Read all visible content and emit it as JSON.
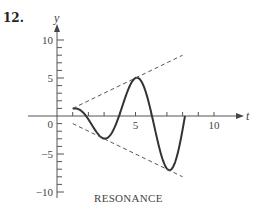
{
  "problem": {
    "number": "12."
  },
  "chart_data": {
    "type": "line",
    "title": "",
    "caption": "RESONANCE",
    "xlabel": "t",
    "ylabel": "y",
    "xlim": [
      0,
      11
    ],
    "ylim": [
      -10.5,
      11
    ],
    "x_ticks": [
      0,
      1,
      2,
      3,
      4,
      5,
      6,
      7,
      8,
      9,
      10
    ],
    "x_tick_labels": {
      "5": "5",
      "10": "10"
    },
    "y_ticks": [
      -10,
      -9,
      -8,
      -7,
      -6,
      -5,
      -4,
      -3,
      -2,
      -1,
      1,
      2,
      3,
      4,
      5,
      6,
      7,
      8,
      9,
      10
    ],
    "y_tick_labels": {
      "10": "10",
      "5": "5",
      "0": "0",
      "-5": "−5",
      "-10": "−10"
    },
    "grid": false,
    "legend": null,
    "series": [
      {
        "name": "solution",
        "style": "solid",
        "formula": "y = t*cos(pi*(t-0.8)/2.1)",
        "points": [
          [
            1.0,
            1.0
          ],
          [
            1.5,
            0.7
          ],
          [
            2.0,
            -0.8
          ],
          [
            2.5,
            -2.3
          ],
          [
            2.9,
            -2.9
          ],
          [
            3.5,
            -2.5
          ],
          [
            4.0,
            -0.6
          ],
          [
            4.5,
            2.6
          ],
          [
            5.0,
            5.0
          ],
          [
            5.5,
            4.3
          ],
          [
            6.0,
            0.9
          ],
          [
            6.5,
            -4.0
          ],
          [
            7.1,
            -7.1
          ],
          [
            7.5,
            -6.5
          ],
          [
            8.0,
            -2.5
          ],
          [
            8.15,
            0.0
          ]
        ]
      },
      {
        "name": "upper envelope y = t",
        "style": "dashed",
        "points": [
          [
            1.0,
            1.0
          ],
          [
            8.0,
            8.0
          ]
        ]
      },
      {
        "name": "lower envelope y = -t",
        "style": "dashed",
        "points": [
          [
            1.0,
            -1.0
          ],
          [
            8.0,
            -8.0
          ]
        ]
      }
    ]
  }
}
